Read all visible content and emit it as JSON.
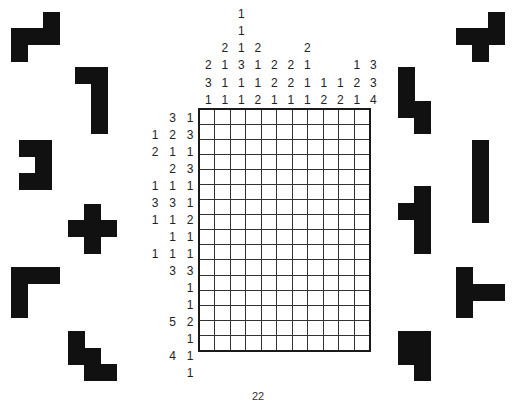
{
  "puzzle": {
    "type": "nonogram",
    "rows": 16,
    "cols": 11,
    "column_clues": [
      [
        2,
        3,
        1
      ],
      [
        2,
        1,
        1,
        1
      ],
      [
        1,
        1,
        1,
        3,
        1,
        1
      ],
      [
        2,
        1,
        1,
        2
      ],
      [
        2,
        2,
        1
      ],
      [
        2,
        2,
        1
      ],
      [
        2,
        1,
        1,
        1
      ],
      [
        1,
        2
      ],
      [
        1,
        2
      ],
      [
        1,
        2,
        1
      ],
      [
        3,
        3,
        4
      ]
    ],
    "row_clues": [
      [
        3,
        1
      ],
      [
        1,
        2,
        3
      ],
      [
        2,
        1,
        1
      ],
      [
        2,
        3
      ],
      [
        1,
        1,
        1
      ],
      [
        3,
        3,
        1
      ],
      [
        1,
        1,
        2
      ],
      [
        1,
        1
      ],
      [
        1,
        1,
        1
      ],
      [
        3,
        3
      ],
      [
        1
      ],
      [
        1
      ],
      [
        5,
        2
      ],
      [
        1
      ],
      [
        4,
        1
      ],
      [
        1
      ]
    ]
  },
  "pieces_left": [
    {
      "name": "s-tetromino-piece",
      "cells": [
        [
          43,
          12
        ],
        [
          11,
          28
        ],
        [
          27,
          28
        ],
        [
          43,
          28
        ],
        [
          11,
          45
        ]
      ]
    },
    {
      "name": "j-hook-piece",
      "cells": [
        [
          75,
          67
        ],
        [
          91,
          67
        ],
        [
          91,
          84
        ],
        [
          91,
          101
        ],
        [
          91,
          117
        ]
      ]
    },
    {
      "name": "c-shape-piece",
      "cells": [
        [
          19,
          140
        ],
        [
          35,
          140
        ],
        [
          35,
          157
        ],
        [
          19,
          173
        ],
        [
          35,
          173
        ]
      ]
    },
    {
      "name": "plus-piece",
      "cells": [
        [
          84,
          204
        ],
        [
          68,
          220
        ],
        [
          84,
          220
        ],
        [
          100,
          220
        ],
        [
          84,
          237
        ]
      ]
    },
    {
      "name": "l-corner-piece",
      "cells": [
        [
          11,
          267
        ],
        [
          27,
          267
        ],
        [
          43,
          267
        ],
        [
          11,
          284
        ],
        [
          11,
          301
        ]
      ]
    },
    {
      "name": "w-stair-piece",
      "cells": [
        [
          68,
          331
        ],
        [
          68,
          348
        ],
        [
          84,
          348
        ],
        [
          84,
          364
        ],
        [
          100,
          364
        ]
      ]
    }
  ],
  "pieces_right": [
    {
      "name": "f-piece",
      "cells": [
        [
          488,
          12
        ],
        [
          456,
          28
        ],
        [
          472,
          28
        ],
        [
          488,
          28
        ],
        [
          472,
          45
        ]
      ]
    },
    {
      "name": "n-piece",
      "cells": [
        [
          398,
          67
        ],
        [
          398,
          84
        ],
        [
          398,
          101
        ],
        [
          414,
          101
        ],
        [
          414,
          117
        ]
      ]
    },
    {
      "name": "i-bar-piece",
      "cells": [
        [
          472,
          140
        ],
        [
          472,
          157
        ],
        [
          472,
          173
        ],
        [
          472,
          190
        ],
        [
          472,
          206
        ]
      ]
    },
    {
      "name": "t-left-piece",
      "cells": [
        [
          414,
          186
        ],
        [
          398,
          203
        ],
        [
          414,
          203
        ],
        [
          414,
          220
        ],
        [
          414,
          237
        ]
      ]
    },
    {
      "name": "t-right-piece",
      "cells": [
        [
          456,
          267
        ],
        [
          456,
          284
        ],
        [
          472,
          284
        ],
        [
          488,
          284
        ],
        [
          456,
          301
        ]
      ]
    },
    {
      "name": "p-piece",
      "cells": [
        [
          398,
          331
        ],
        [
          414,
          331
        ],
        [
          398,
          348
        ],
        [
          414,
          348
        ],
        [
          414,
          364
        ]
      ]
    }
  ],
  "page_number": "22",
  "colors": {
    "ink": "#111111",
    "grid_line": "#333333",
    "background": "#ffffff"
  }
}
